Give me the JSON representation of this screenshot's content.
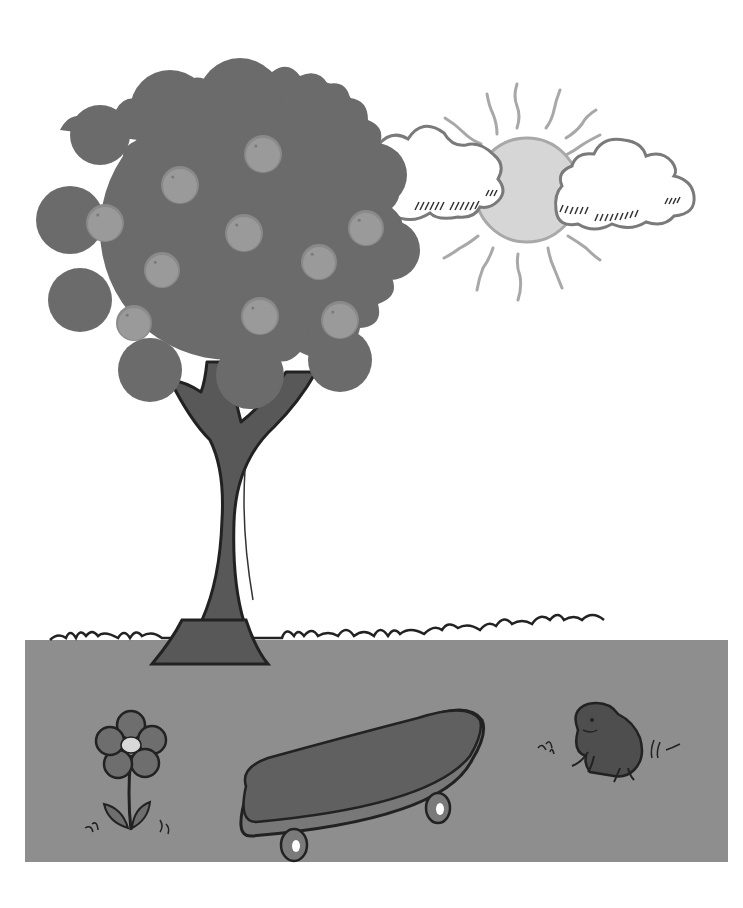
{
  "scene": {
    "description": "Grayscale cartoon: tree with fruit, sun behind clouds, grass field with flower, skateboard and frog",
    "colors": {
      "background": "#ffffff",
      "foliage": "#6b6b6b",
      "fruit": "#9a9a9a",
      "fruit_rim": "#8a8a8a",
      "trunk": "#585858",
      "outline": "#222222",
      "ground": "#8e8e8e",
      "sun": "#d6d6d6",
      "sun_outline": "#a8a8a8",
      "ray": "#a8a8a8",
      "cloud_fill": "#ffffff",
      "cloud_outline": "#7a7a7a",
      "flower_petal": "#6e6e6e",
      "flower_center": "#d8d8d8",
      "skateboard_deck": "#606060",
      "skateboard_edge": "#787878",
      "wheel": "#7a7a7a",
      "frog": "#4e4e4e"
    },
    "fruits": [
      {
        "cx": 263,
        "cy": 154,
        "r": 18
      },
      {
        "cx": 180,
        "cy": 185,
        "r": 18
      },
      {
        "cx": 105,
        "cy": 223,
        "r": 18
      },
      {
        "cx": 244,
        "cy": 233,
        "r": 18
      },
      {
        "cx": 366,
        "cy": 228,
        "r": 17
      },
      {
        "cx": 162,
        "cy": 270,
        "r": 17
      },
      {
        "cx": 319,
        "cy": 262,
        "r": 17
      },
      {
        "cx": 134,
        "cy": 323,
        "r": 17
      },
      {
        "cx": 260,
        "cy": 316,
        "r": 18
      },
      {
        "cx": 340,
        "cy": 320,
        "r": 18
      }
    ],
    "objects": {
      "tree": "tree",
      "sun": "sun",
      "clouds": 2,
      "flower": "flower",
      "skateboard": "skateboard",
      "frog": "frog"
    }
  }
}
